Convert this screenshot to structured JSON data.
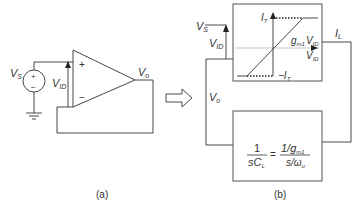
{
  "figure": {
    "panel_a": {
      "caption": "(a)",
      "source_label": "V",
      "source_sub": "S",
      "source_plus": "+",
      "source_minus": "−",
      "vid_label": "V",
      "vid_sub": "ID",
      "opamp_plus": "+",
      "opamp_minus": "−",
      "output_label": "V",
      "output_sub": "o"
    },
    "transform_arrow": "right-arrow",
    "panel_b": {
      "caption": "(b)",
      "input_label": "V",
      "input_sub": "S",
      "vid_label": "V",
      "vid_sub": "ID",
      "output_label": "V",
      "output_sub": "o",
      "load_current_label": "I",
      "load_current_sub": "L",
      "transfer_curve": {
        "y_axis_label": "I",
        "y_axis_sub": "T",
        "x_axis_label": "V",
        "x_axis_sub": "ID",
        "slope_label": "g",
        "slope_sub": "m1",
        "slope_var": "V",
        "slope_var_sub": "ID",
        "neg_sat_label": "−I",
        "neg_sat_sub": "T"
      },
      "load_block": {
        "lhs_num": "1",
        "lhs_den": "sC",
        "lhs_den_sub": "L",
        "equals": "=",
        "rhs_num": "1/g",
        "rhs_num_sub": "m1",
        "rhs_den": "s/ω",
        "rhs_den_sub": "u"
      }
    }
  }
}
